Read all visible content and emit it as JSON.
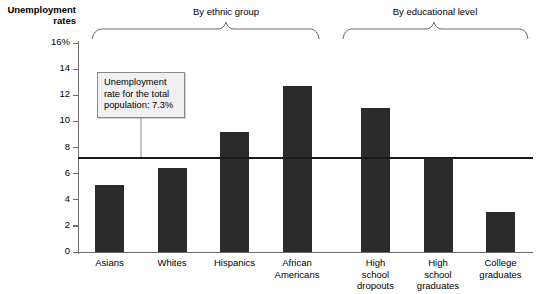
{
  "chart_data": {
    "type": "bar",
    "title": "",
    "ylabel": "Unemployment rates",
    "xlabel": "",
    "ylim": [
      0,
      16
    ],
    "ytick_labels": [
      "16%",
      "14",
      "12",
      "10",
      "8",
      "6",
      "4",
      "2",
      "0"
    ],
    "ytick_values": [
      16,
      14,
      12,
      10,
      8,
      6,
      4,
      2,
      0
    ],
    "grid": false,
    "legend": "none",
    "categories": [
      "Asians",
      "Whites",
      "Hispanics",
      "African Americans",
      "High school dropouts",
      "High school graduates",
      "College graduates"
    ],
    "values": [
      5.1,
      6.4,
      9.2,
      12.7,
      11.0,
      7.3,
      3.1
    ],
    "bar_color": "#2b2b2b",
    "reference_line": {
      "value": 7.3,
      "label": "Unemployment rate for the total population: 7.3%",
      "color": "#1a1a1a"
    },
    "annotations": [
      {
        "text": "By ethnic group",
        "covers": [
          "Asians",
          "Whites",
          "Hispanics",
          "African Americans"
        ]
      },
      {
        "text": "By educational level",
        "covers": [
          "High school dropouts",
          "High school graduates",
          "College graduates"
        ]
      }
    ]
  },
  "axis": {
    "y_title_line1": "Unemployment",
    "y_title_line2": "rates"
  },
  "xlabels": [
    {
      "line1": "Asians",
      "line2": "",
      "line3": ""
    },
    {
      "line1": "Whites",
      "line2": "",
      "line3": ""
    },
    {
      "line1": "Hispanics",
      "line2": "",
      "line3": ""
    },
    {
      "line1": "African",
      "line2": "Americans",
      "line3": ""
    },
    {
      "line1": "High",
      "line2": "school",
      "line3": "dropouts"
    },
    {
      "line1": "High",
      "line2": "school",
      "line3": "graduates"
    },
    {
      "line1": "College",
      "line2": "graduates",
      "line3": ""
    }
  ],
  "groups": [
    {
      "label": "By ethnic group"
    },
    {
      "label": "By educational level"
    }
  ],
  "callout": {
    "line1": "Unemployment",
    "line2": "rate for the total",
    "line3": "population: 7.3%"
  }
}
